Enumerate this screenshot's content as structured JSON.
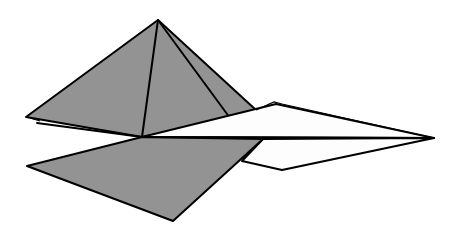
{
  "figure": {
    "colors": {
      "background": "#ffffff",
      "shaded_face": "#939393",
      "light_face": "#fdfdfd",
      "outline": "#000000"
    },
    "vertices": {
      "apex": [
        158,
        20
      ],
      "left": [
        26,
        117
      ],
      "center": [
        142,
        137
      ],
      "pyramid_right": [
        256,
        110
      ],
      "inner_fold": [
        230,
        118
      ],
      "white_top": [
        276,
        104
      ],
      "right_tip": [
        434,
        138
      ],
      "white_bottom": [
        282,
        170
      ],
      "white_bottom_left": [
        242,
        161
      ],
      "lower_left": [
        27,
        166
      ],
      "lower_bottom": [
        173,
        221
      ],
      "lower_right": [
        263,
        139
      ]
    }
  }
}
